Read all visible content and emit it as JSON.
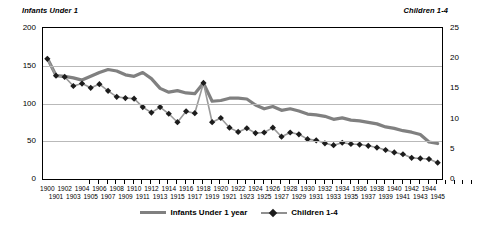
{
  "chart_data": {
    "type": "line",
    "title": "",
    "xlabel": "",
    "ylabel": "Infants Under 1",
    "y2label": "Children 1-4",
    "ylim": [
      0,
      200
    ],
    "y2lim": [
      0,
      25
    ],
    "yticks": [
      "0",
      "50",
      "100",
      "150",
      "200"
    ],
    "y2ticks": [
      "0",
      "5",
      "10",
      "15",
      "20",
      "25"
    ],
    "grid": true,
    "legend_position": "bottom",
    "x": [
      1900,
      1901,
      1902,
      1903,
      1904,
      1905,
      1906,
      1907,
      1908,
      1909,
      1910,
      1911,
      1912,
      1913,
      1914,
      1915,
      1916,
      1917,
      1918,
      1919,
      1920,
      1921,
      1922,
      1923,
      1924,
      1925,
      1926,
      1927,
      1928,
      1929,
      1930,
      1931,
      1932,
      1933,
      1934,
      1935,
      1936,
      1937,
      1938,
      1939,
      1940,
      1941,
      1942,
      1943,
      1944,
      1945
    ],
    "xtick_labels": [
      "1900",
      "1901",
      "1902",
      "1903",
      "1904",
      "1905",
      "1906",
      "1907",
      "1908",
      "1909",
      "1910",
      "1911",
      "1912",
      "1913",
      "1914",
      "1915",
      "1916",
      "1917",
      "1918",
      "1919",
      "1920",
      "1921",
      "1922",
      "1923",
      "1924",
      "1925",
      "1926",
      "1927",
      "1928",
      "1929",
      "1930",
      "1931",
      "1932",
      "1933",
      "1934",
      "1935",
      "1936",
      "1937",
      "1938",
      "1939",
      "1940",
      "1941",
      "1942",
      "1943",
      "1944",
      "1945"
    ],
    "series": [
      {
        "name": "Infants Under 1 year",
        "axis": "left",
        "color": "#808080",
        "style": "thick-line",
        "values": [
          160,
          137,
          136,
          134,
          131,
          136,
          141,
          145,
          143,
          138,
          136,
          141,
          133,
          120,
          115,
          117,
          114,
          113,
          127,
          103,
          104,
          107,
          107,
          106,
          98,
          93,
          96,
          91,
          93,
          90,
          86,
          85,
          83,
          79,
          81,
          78,
          77,
          75,
          73,
          69,
          67,
          64,
          62,
          59,
          49,
          47
        ]
      },
      {
        "name": "Children 1-4",
        "axis": "right",
        "color": "#1c1c1c",
        "style": "diamond-markers",
        "values": [
          19.9,
          17.1,
          16.9,
          15.4,
          15.8,
          15.1,
          15.7,
          14.6,
          13.6,
          13.4,
          13.3,
          11.9,
          11.0,
          11.9,
          10.8,
          9.4,
          11.2,
          10.9,
          15.9,
          9.4,
          10.1,
          8.5,
          7.8,
          8.4,
          7.6,
          7.7,
          8.5,
          7.0,
          7.7,
          7.4,
          6.6,
          6.4,
          5.9,
          5.6,
          6.0,
          5.8,
          5.7,
          5.5,
          5.2,
          4.8,
          4.4,
          4.1,
          3.5,
          3.4,
          3.3,
          2.7
        ]
      }
    ]
  },
  "legend": {
    "items": [
      {
        "label": "Infants Under 1 year"
      },
      {
        "label": "Children 1-4"
      }
    ]
  },
  "axes": {
    "left_title": "Infants Under 1",
    "right_title": "Children 1-4"
  }
}
